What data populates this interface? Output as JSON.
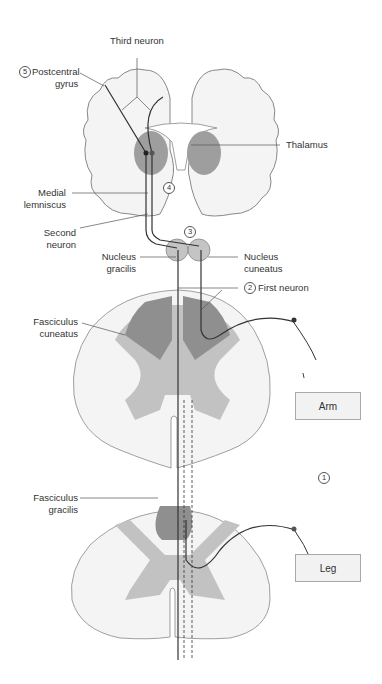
{
  "labels": {
    "third_neuron": "Third neuron",
    "postcentral_gyrus_line1": "Postcentral",
    "postcentral_gyrus_line2": "gyrus",
    "postcentral_gyrus_num": "5",
    "thalamus": "Thalamus",
    "medial_lemniscus_line1": "Medial",
    "medial_lemniscus_line2": "lemniscus",
    "medial_lemniscus_num": "4",
    "second_neuron_line1": "Second",
    "second_neuron_line2": "neuron",
    "decussation_num": "3",
    "nucleus_gracilis_line1": "Nucleus",
    "nucleus_gracilis_line2": "gracilis",
    "nucleus_cuneatus_line1": "Nucleus",
    "nucleus_cuneatus_line2": "cuneatus",
    "first_neuron": "First neuron",
    "first_neuron_num": "2",
    "fasciculus_cuneatus_line1": "Fasciculus",
    "fasciculus_cuneatus_line2": "cuneatus",
    "fasciculus_gracilis_line1": "Fasciculus",
    "fasciculus_gracilis_line2": "gracilis",
    "receptor_num": "1",
    "arm": "Arm",
    "leg": "Leg"
  },
  "colors": {
    "white_matter": "#f4f4f4",
    "gray_matter": "#bdbdbd",
    "tract_dark": "#8f8f8f",
    "outline": "#888888",
    "neuron": "#333333"
  }
}
